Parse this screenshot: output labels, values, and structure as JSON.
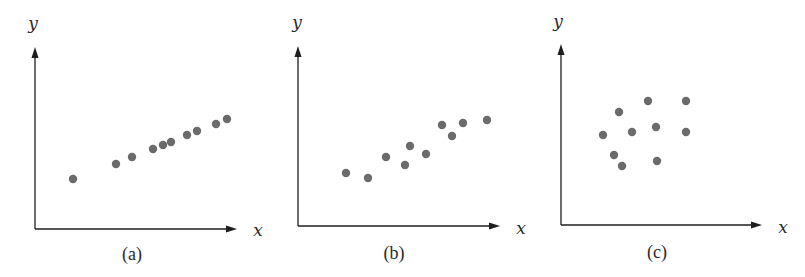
{
  "chart_data": [
    {
      "type": "scatter",
      "title": "",
      "panel_label": "(a)",
      "xlabel": "x",
      "ylabel": "y",
      "grid": false,
      "xlim": [
        0,
        200
      ],
      "ylim": [
        0,
        180
      ],
      "points": [
        {
          "x": 38,
          "y": 50
        },
        {
          "x": 81,
          "y": 65
        },
        {
          "x": 97,
          "y": 72
        },
        {
          "x": 118,
          "y": 80
        },
        {
          "x": 128,
          "y": 84
        },
        {
          "x": 136,
          "y": 87
        },
        {
          "x": 152,
          "y": 94
        },
        {
          "x": 162,
          "y": 98
        },
        {
          "x": 181,
          "y": 105
        },
        {
          "x": 192,
          "y": 110
        }
      ],
      "layout": {
        "origin_px": [
          35,
          229
        ],
        "x_axis_end_px": 237,
        "y_axis_top_px": 47,
        "xlabel_px": [
          258,
          236
        ],
        "ylabel_px": [
          33,
          29
        ],
        "panel_label_px": [
          132,
          260
        ]
      }
    },
    {
      "type": "scatter",
      "title": "",
      "panel_label": "(b)",
      "xlabel": "x",
      "ylabel": "y",
      "grid": false,
      "xlim": [
        0,
        200
      ],
      "ylim": [
        0,
        180
      ],
      "points": [
        {
          "x": 48,
          "y": 53
        },
        {
          "x": 70,
          "y": 48
        },
        {
          "x": 88,
          "y": 69
        },
        {
          "x": 107,
          "y": 61
        },
        {
          "x": 112,
          "y": 80
        },
        {
          "x": 128,
          "y": 72
        },
        {
          "x": 144,
          "y": 101
        },
        {
          "x": 154,
          "y": 90
        },
        {
          "x": 165,
          "y": 103
        },
        {
          "x": 189,
          "y": 106
        }
      ],
      "layout": {
        "origin_px": [
          298,
          226
        ],
        "x_axis_end_px": 500,
        "y_axis_top_px": 46,
        "xlabel_px": [
          521,
          234
        ],
        "ylabel_px": [
          297,
          28
        ],
        "panel_label_px": [
          394,
          259
        ]
      }
    },
    {
      "type": "scatter",
      "title": "",
      "panel_label": "(c)",
      "xlabel": "x",
      "ylabel": "y",
      "grid": false,
      "xlim": [
        0,
        200
      ],
      "ylim": [
        0,
        180
      ],
      "points": [
        {
          "x": 42,
          "y": 90
        },
        {
          "x": 58,
          "y": 113
        },
        {
          "x": 53,
          "y": 70
        },
        {
          "x": 61,
          "y": 59
        },
        {
          "x": 71,
          "y": 93
        },
        {
          "x": 87,
          "y": 124
        },
        {
          "x": 95,
          "y": 98
        },
        {
          "x": 96,
          "y": 64
        },
        {
          "x": 125,
          "y": 124
        },
        {
          "x": 125,
          "y": 93
        }
      ],
      "layout": {
        "origin_px": [
          561,
          225
        ],
        "x_axis_end_px": 762,
        "y_axis_top_px": 44,
        "xlabel_px": [
          783,
          233
        ],
        "ylabel_px": [
          558,
          27
        ],
        "panel_label_px": [
          657,
          258
        ]
      }
    }
  ],
  "colors": {
    "axis": "#1e1e1e",
    "dot": "#6b6b6b",
    "background": "#ffffff"
  },
  "dot_radius": 4.2
}
